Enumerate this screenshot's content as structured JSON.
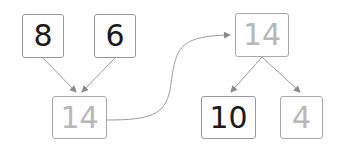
{
  "diagram": {
    "type": "number-bond",
    "nodes": [
      {
        "id": "a",
        "value": "8",
        "style": "dark"
      },
      {
        "id": "b",
        "value": "6",
        "style": "dark"
      },
      {
        "id": "sum",
        "value": "14",
        "style": "light"
      },
      {
        "id": "whole",
        "value": "14",
        "style": "light"
      },
      {
        "id": "part1",
        "value": "10",
        "style": "dark"
      },
      {
        "id": "part2",
        "value": "4",
        "style": "light"
      }
    ],
    "edges": [
      {
        "from": "a",
        "to": "sum"
      },
      {
        "from": "b",
        "to": "sum"
      },
      {
        "from": "sum",
        "to": "whole"
      },
      {
        "from": "whole",
        "to": "part1"
      },
      {
        "from": "whole",
        "to": "part2"
      }
    ],
    "colors": {
      "dark_text": "#1a1a1a",
      "light_text": "#b8b8b8",
      "line": "#9a9a9a"
    }
  }
}
